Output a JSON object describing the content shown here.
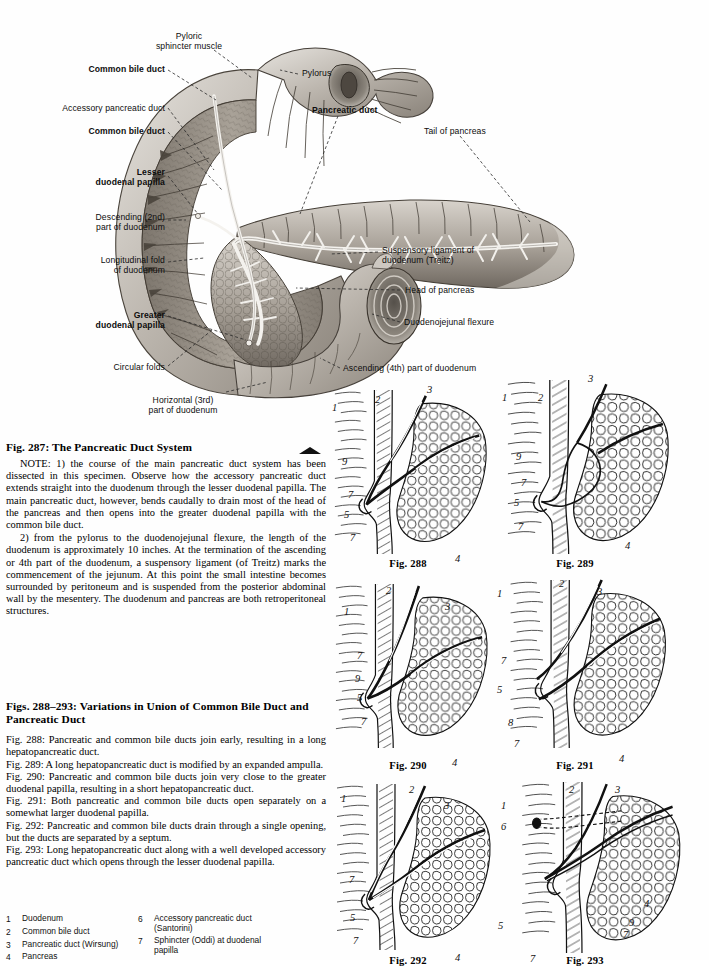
{
  "plate": {
    "title": "The Pancreatic Duct System",
    "labels": [
      {
        "id": "pyloric-sphincter-muscle",
        "text": "Pyloric\nsphincter muscle",
        "bold": false,
        "align": "center",
        "x": 134,
        "y": 31,
        "w": 110
      },
      {
        "id": "common-bile-duct-upper",
        "text": "Common bile duct",
        "bold": true,
        "align": "right",
        "x": 20,
        "y": 64,
        "w": 145
      },
      {
        "id": "pylorus",
        "text": "Pylorus",
        "bold": false,
        "align": "left",
        "x": 302,
        "y": 68,
        "w": 80
      },
      {
        "id": "accessory-pancreatic-duct",
        "text": "Accessory pancreatic duct",
        "bold": false,
        "align": "right",
        "x": 8,
        "y": 103,
        "w": 157
      },
      {
        "id": "pancreatic-duct",
        "text": "Pancreatic duct",
        "bold": true,
        "align": "left",
        "x": 312,
        "y": 105,
        "w": 110
      },
      {
        "id": "common-bile-duct-lower",
        "text": "Common bile duct",
        "bold": true,
        "align": "right",
        "x": 20,
        "y": 126,
        "w": 145
      },
      {
        "id": "tail-of-pancreas",
        "text": "Tail of pancreas",
        "bold": false,
        "align": "left",
        "x": 424,
        "y": 126,
        "w": 100
      },
      {
        "id": "lesser-duodenal-papilla",
        "text": "Lesser\nduodenal papilla",
        "bold": true,
        "align": "right",
        "x": 10,
        "y": 167,
        "w": 155
      },
      {
        "id": "descending-2nd-part-of-duodenum",
        "text": "Descending (2nd)\npart of duodenum",
        "bold": false,
        "align": "right",
        "x": 0,
        "y": 212,
        "w": 165
      },
      {
        "id": "suspensory-ligament-of-duodenum",
        "text": "Suspensory ligament of\nduodenum (Treitz)",
        "bold": false,
        "align": "left",
        "x": 382,
        "y": 245,
        "w": 150
      },
      {
        "id": "longitudinal-fold-of-duodenum",
        "text": "Longitudinal fold\nof duodenum",
        "bold": false,
        "align": "right",
        "x": 10,
        "y": 255,
        "w": 155
      },
      {
        "id": "head-of-pancreas",
        "text": "Head of pancreas",
        "bold": false,
        "align": "left",
        "x": 405,
        "y": 285,
        "w": 120
      },
      {
        "id": "greater-duodenal-papilla",
        "text": "Greater\nduodenal papilla",
        "bold": true,
        "align": "right",
        "x": 10,
        "y": 310,
        "w": 155
      },
      {
        "id": "duodenojejunal-flexure",
        "text": "Duodenojejunal flexure",
        "bold": false,
        "align": "left",
        "x": 404,
        "y": 317,
        "w": 140
      },
      {
        "id": "circular-folds",
        "text": "Circular folds",
        "bold": false,
        "align": "right",
        "x": 40,
        "y": 362,
        "w": 125
      },
      {
        "id": "ascending-4th-part-of-duodenum",
        "text": "Ascending (4th) part of duodenum",
        "bold": false,
        "align": "left",
        "x": 343,
        "y": 363,
        "w": 190
      },
      {
        "id": "horizontal-3rd-part-of-duodenum",
        "text": "Horizontal (3rd)\npart of duodenum",
        "bold": false,
        "align": "center",
        "x": 128,
        "y": 395,
        "w": 110
      }
    ]
  },
  "fig287": {
    "heading": "Fig. 287:  The Pancreatic Duct System",
    "paragraphs": [
      "NOTE: 1) the course of the main pancreatic duct system has been dissected in this specimen. Observe how the accessory pancreatic duct extends straight into the duodenum through the lesser duodenal papilla. The main pancreatic duct, however, bends caudally to drain most of the head of the pancreas and then opens into the greater duodenal papilla with the common bile duct.",
      "2) from the pylorus to the duodenojejunal flexure, the length of the duodenum is approximately 10 inches. At the termination of the ascending or 4th part of the duodenum, a suspensory ligament (of Treitz) marks the commencement of the jejunum. At this point the small intestine becomes surrounded by peritoneum and is suspended from the posterior abdominal wall by the mesentery. The duodenum and pancreas are both retroperitoneal structures."
    ]
  },
  "figs288_293": {
    "heading": "Figs. 288–293:  Variations in Union of Common Bile Duct and Pancreatic Duct",
    "captions": [
      "Fig. 288:  Pancreatic and common bile ducts join early, resulting in a long hepatopancreatic duct.",
      "Fig. 289:  A long hepatopancreatic duct is modified by an expanded ampulla.",
      "Fig. 290:  Pancreatic and common bile ducts join very close to the greater duodenal papilla, resulting in a short hepatopancreatic duct.",
      "Fig. 291:  Both pancreatic and common bile ducts open separately on a somewhat larger duodenal papilla.",
      "Fig. 292:  Pancreatic and common bile ducts drain through a single opening, but the ducts are separated by a septum.",
      "Fig. 293:  Long hepatopancreatic duct along with a well developed accessory pancreatic duct which opens through the lesser duodenal papilla."
    ]
  },
  "panels": [
    {
      "id": "fig-288",
      "caption": "Fig. 288",
      "x": 330,
      "y": 388,
      "w": 160,
      "h": 168,
      "cap_x": 378,
      "cap_y": 558,
      "numbers": [
        {
          "n": "1",
          "x": 332,
          "y": 402
        },
        {
          "n": "2",
          "x": 375,
          "y": 394
        },
        {
          "n": "3",
          "x": 427,
          "y": 384
        },
        {
          "n": "9",
          "x": 342,
          "y": 456
        },
        {
          "n": "7",
          "x": 348,
          "y": 489
        },
        {
          "n": "5",
          "x": 344,
          "y": 509
        },
        {
          "n": "7",
          "x": 350,
          "y": 532
        },
        {
          "n": "4",
          "x": 455,
          "y": 553
        }
      ]
    },
    {
      "id": "fig-289",
      "caption": "Fig. 289",
      "x": 495,
      "y": 378,
      "w": 185,
      "h": 178,
      "cap_x": 545,
      "cap_y": 558,
      "numbers": [
        {
          "n": "1",
          "x": 502,
          "y": 392
        },
        {
          "n": "2",
          "x": 538,
          "y": 392
        },
        {
          "n": "3",
          "x": 588,
          "y": 373
        },
        {
          "n": "9",
          "x": 516,
          "y": 451
        },
        {
          "n": "7",
          "x": 521,
          "y": 477
        },
        {
          "n": "5",
          "x": 514,
          "y": 497
        },
        {
          "n": "7",
          "x": 518,
          "y": 521
        },
        {
          "n": "4",
          "x": 625,
          "y": 540
        }
      ]
    },
    {
      "id": "fig-290",
      "caption": "Fig. 290",
      "x": 332,
      "y": 582,
      "w": 158,
      "h": 168,
      "cap_x": 378,
      "cap_y": 760,
      "numbers": [
        {
          "n": "2",
          "x": 386,
          "y": 585
        },
        {
          "n": "1",
          "x": 344,
          "y": 606
        },
        {
          "n": "3",
          "x": 445,
          "y": 601
        },
        {
          "n": "7",
          "x": 357,
          "y": 650
        },
        {
          "n": "9",
          "x": 355,
          "y": 673
        },
        {
          "n": "5",
          "x": 357,
          "y": 692
        },
        {
          "n": "7",
          "x": 361,
          "y": 716
        },
        {
          "n": "4",
          "x": 452,
          "y": 757
        }
      ]
    },
    {
      "id": "fig-291",
      "caption": "Fig. 291",
      "x": 495,
      "y": 578,
      "w": 185,
      "h": 172,
      "cap_x": 545,
      "cap_y": 760,
      "numbers": [
        {
          "n": "1",
          "x": 497,
          "y": 588
        },
        {
          "n": "2",
          "x": 559,
          "y": 578
        },
        {
          "n": "3",
          "x": 597,
          "y": 586
        },
        {
          "n": "7",
          "x": 501,
          "y": 655
        },
        {
          "n": "5",
          "x": 497,
          "y": 684
        },
        {
          "n": "8",
          "x": 508,
          "y": 717
        },
        {
          "n": "7",
          "x": 514,
          "y": 738
        },
        {
          "n": "4",
          "x": 619,
          "y": 753
        }
      ]
    },
    {
      "id": "fig-292",
      "caption": "Fig. 292",
      "x": 333,
      "y": 782,
      "w": 160,
      "h": 170,
      "cap_x": 378,
      "cap_y": 955,
      "numbers": [
        {
          "n": "1",
          "x": 341,
          "y": 793
        },
        {
          "n": "2",
          "x": 409,
          "y": 784
        },
        {
          "n": "3",
          "x": 444,
          "y": 800
        },
        {
          "n": "7",
          "x": 349,
          "y": 874
        },
        {
          "n": "5",
          "x": 350,
          "y": 912
        },
        {
          "n": "7",
          "x": 353,
          "y": 935
        },
        {
          "n": "4",
          "x": 455,
          "y": 952
        }
      ]
    },
    {
      "id": "fig-293",
      "caption": "Fig. 293",
      "x": 498,
      "y": 780,
      "w": 205,
      "h": 175,
      "cap_x": 555,
      "cap_y": 955,
      "numbers": [
        {
          "n": "1",
          "x": 501,
          "y": 800
        },
        {
          "n": "2",
          "x": 569,
          "y": 784
        },
        {
          "n": "3",
          "x": 615,
          "y": 784
        },
        {
          "n": "6",
          "x": 501,
          "y": 821
        },
        {
          "n": "5",
          "x": 498,
          "y": 920
        },
        {
          "n": "4",
          "x": 644,
          "y": 898
        },
        {
          "n": "9",
          "x": 629,
          "y": 917
        },
        {
          "n": "7",
          "x": 623,
          "y": 929
        },
        {
          "n": "7",
          "x": 530,
          "y": 953
        }
      ]
    }
  ],
  "key": {
    "left": [
      {
        "n": "1",
        "text": "Duodenum"
      },
      {
        "n": "2",
        "text": "Common bile duct"
      },
      {
        "n": "3",
        "text": "Pancreatic duct (Wirsung)"
      },
      {
        "n": "4",
        "text": "Pancreas"
      }
    ],
    "right": [
      {
        "n": "6",
        "text": "Accessory pancreatic duct\n(Santorini)"
      },
      {
        "n": "7",
        "text": "Sphincter (Oddi) at duodenal\npapilla"
      }
    ]
  },
  "colors": {
    "ink": "#111111",
    "paper": "#fefefe",
    "tissue_light": "#cfcbc6",
    "tissue_mid": "#9e9890",
    "tissue_dark": "#6b645c",
    "duct_white": "#f2f0ec"
  }
}
